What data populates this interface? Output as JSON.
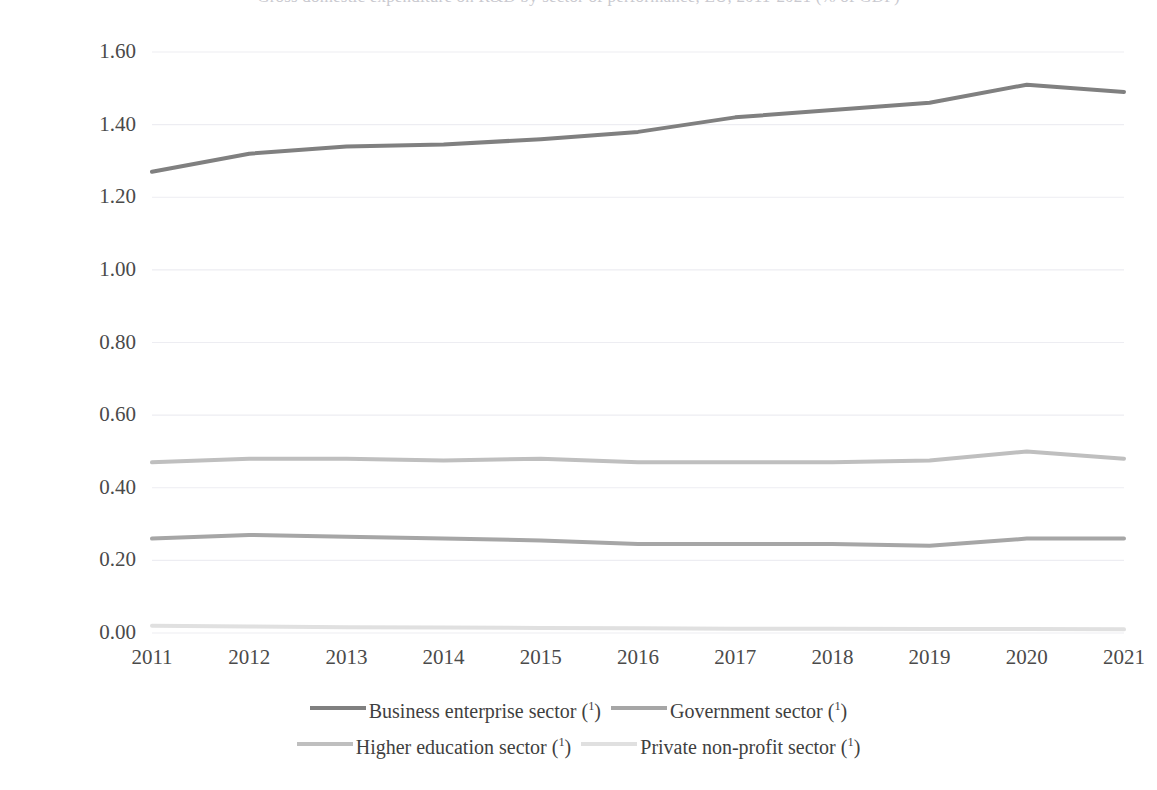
{
  "title": "Gross domestic expenditure on R&D by sector of performance, EU, 2011-2021 (% of GDP)",
  "chart_data": {
    "type": "line",
    "title": "Gross domestic expenditure on R&D by sector of performance, EU, 2011-2021 (% of GDP)",
    "xlabel": "",
    "ylabel": "",
    "x": [
      2011,
      2012,
      2013,
      2014,
      2015,
      2016,
      2017,
      2018,
      2019,
      2020,
      2021
    ],
    "categories": [
      "2011",
      "2012",
      "2013",
      "2014",
      "2015",
      "2016",
      "2017",
      "2018",
      "2019",
      "2020",
      "2021"
    ],
    "ylim": [
      0.0,
      1.6
    ],
    "ytick_labels": [
      "0.00",
      "0.20",
      "0.40",
      "0.60",
      "0.80",
      "1.00",
      "1.20",
      "1.40",
      "1.60"
    ],
    "ytick_values": [
      0.0,
      0.2,
      0.4,
      0.6,
      0.8,
      1.0,
      1.2,
      1.4,
      1.6
    ],
    "grid": true,
    "legend_position": "bottom",
    "series": [
      {
        "name": "Business enterprise sector (¹)",
        "color": "#808080",
        "width": 4.0,
        "values": [
          1.27,
          1.32,
          1.34,
          1.345,
          1.36,
          1.38,
          1.42,
          1.44,
          1.46,
          1.51,
          1.49
        ]
      },
      {
        "name": "Government sector (¹)",
        "color": "#a6a6a6",
        "width": 4.0,
        "values": [
          0.26,
          0.27,
          0.265,
          0.26,
          0.255,
          0.245,
          0.245,
          0.245,
          0.24,
          0.26,
          0.26
        ]
      },
      {
        "name": "Higher education sector (¹)",
        "color": "#bfbfbf",
        "width": 4.0,
        "values": [
          0.47,
          0.48,
          0.48,
          0.475,
          0.48,
          0.47,
          0.47,
          0.47,
          0.475,
          0.5,
          0.48
        ]
      },
      {
        "name": "Private non-profit sector (¹)",
        "color": "#e0e0e0",
        "width": 4.0,
        "values": [
          0.02,
          0.018,
          0.016,
          0.015,
          0.014,
          0.013,
          0.012,
          0.012,
          0.011,
          0.011,
          0.01
        ]
      }
    ]
  },
  "legend": {
    "rows": [
      [
        {
          "label": "Business enterprise sector (",
          "sup": "1",
          "tail": ")",
          "color": "#808080",
          "name": "legend-business-enterprise-sector"
        },
        {
          "label": "Government sector (",
          "sup": "1",
          "tail": ")",
          "color": "#a6a6a6",
          "name": "legend-government-sector"
        }
      ],
      [
        {
          "label": "Higher education sector (",
          "sup": "1",
          "tail": ")",
          "color": "#bfbfbf",
          "name": "legend-higher-education-sector"
        },
        {
          "label": "Private non-profit sector (",
          "sup": "1",
          "tail": ")",
          "color": "#e0e0e0",
          "name": "legend-private-non-profit-sector"
        }
      ]
    ]
  },
  "axes": {
    "y_labels": [
      "1.60",
      "1.40",
      "1.20",
      "1.00",
      "0.80",
      "0.60",
      "0.40",
      "0.20",
      "0.00"
    ],
    "x_labels": [
      "2011",
      "2012",
      "2013",
      "2014",
      "2015",
      "2016",
      "2017",
      "2018",
      "2019",
      "2020",
      "2021"
    ]
  },
  "style": {
    "grid_color": "#ededf2",
    "tick_text_color": "#4a4a4a",
    "background": "#ffffff"
  }
}
